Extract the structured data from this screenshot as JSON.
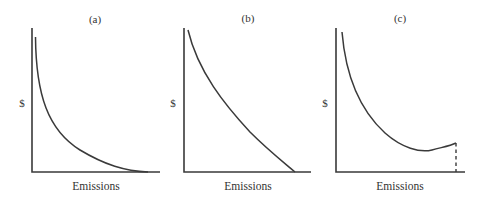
{
  "figure": {
    "panels": [
      {
        "id": "a",
        "label": "(a)",
        "ylabel": "$",
        "xlabel": "Emissions",
        "curve_shape": "convex, steeply decreasing, asymptotic to x-axis"
      },
      {
        "id": "b",
        "label": "(b)",
        "ylabel": "$",
        "xlabel": "Emissions",
        "curve_shape": "mildly convex, decreasing, meets x-axis before axis end"
      },
      {
        "id": "c",
        "label": "(c)",
        "ylabel": "$",
        "xlabel": "Emissions",
        "curve_shape": "U-shaped: decreases to a minimum then rises slightly; dashed vertical drop to x-axis at end"
      }
    ],
    "colors": {
      "line": "#3a3a3a",
      "text": "#333333",
      "background": "#ffffff"
    }
  }
}
